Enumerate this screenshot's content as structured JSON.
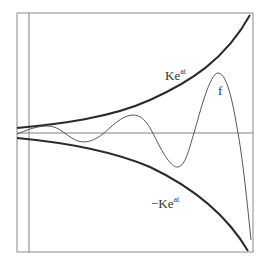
{
  "figure": {
    "labels": {
      "upper_envelope": "Ke",
      "upper_exponent": "at",
      "lower_envelope": "−Ke",
      "lower_exponent": "at",
      "function": "f"
    },
    "colors": {
      "envelope": "#2a2a2a",
      "function": "#555555",
      "axes": "#777777",
      "frame": "#888888"
    }
  }
}
